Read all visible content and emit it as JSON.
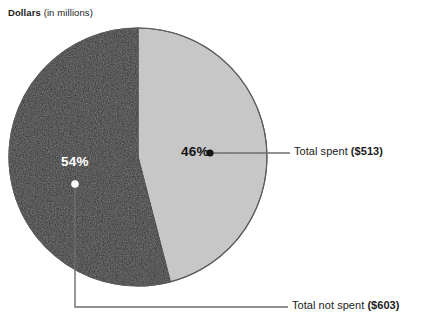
{
  "title": {
    "strong": "Dollars",
    "plain": " (in millions)"
  },
  "colors": {
    "slice_light": "#c9c9c9",
    "slice_dark": "#2b2b2b",
    "slice_outline": "#555555",
    "leader_line": "#6d6d6d",
    "label_text": "#1b1b1b",
    "pct_light_text": "#131313",
    "pct_dark_text": "#ffffff",
    "background": "#ffffff"
  },
  "labels": {
    "spent": {
      "plain": "Total spent ",
      "strong": "($513)"
    },
    "not_spent": {
      "plain": "Total not spent ",
      "strong": "($603)"
    }
  },
  "percent_labels": {
    "light": "46%",
    "dark": "54%"
  },
  "chart_data": {
    "type": "pie",
    "title": "Dollars (in millions)",
    "unit": "millions of dollars",
    "legend_position": "callout-right",
    "grid": false,
    "total": 1116,
    "slices": [
      {
        "label": "Total spent",
        "value": 513,
        "value_display": "($513)",
        "percent": 46,
        "percent_display": "46%",
        "color": "#c9c9c9",
        "start_angle_deg": 0,
        "end_angle_deg": 165.6
      },
      {
        "label": "Total not spent",
        "value": 603,
        "value_display": "($603)",
        "percent": 54,
        "percent_display": "54%",
        "color": "#2b2b2b",
        "start_angle_deg": 165.6,
        "end_angle_deg": 360
      }
    ],
    "categories": [
      "Total spent",
      "Total not spent"
    ],
    "values": [
      513,
      603
    ],
    "percents": [
      46,
      54
    ]
  }
}
